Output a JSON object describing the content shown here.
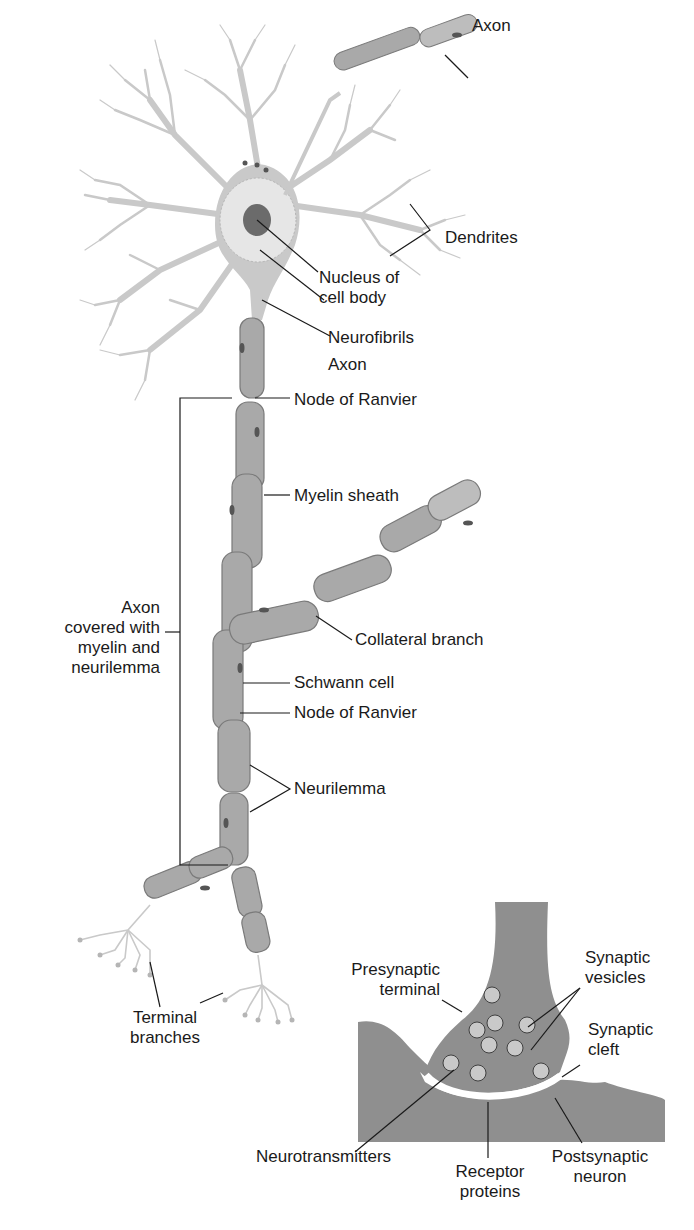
{
  "diagram": {
    "colors": {
      "cell_fill": "#c9c9c9",
      "sheath_fill": "#a9a9a9",
      "sheath_stroke": "#7a7a7a",
      "nucleus": "#6b6b6b",
      "synapse_fill": "#8f8f8f",
      "cleft": "#ffffff",
      "leader_line": "#1a1a1a"
    },
    "labels": {
      "axon_top": "Axon",
      "dendrites": "Dendrites",
      "nucleus_line1": "Nucleus of",
      "nucleus_line2": "cell body",
      "neurofibrils": "Neurofibrils",
      "axon_mid": "Axon",
      "node_of_ranvier_1": "Node of Ranvier",
      "myelin_sheath": "Myelin sheath",
      "axon_covered_line1": "Axon",
      "axon_covered_line2": "covered with",
      "axon_covered_line3": "myelin and",
      "axon_covered_line4": "neurilemma",
      "collateral_branch": "Collateral branch",
      "schwann_cell": "Schwann cell",
      "node_of_ranvier_2": "Node of Ranvier",
      "neurilemma": "Neurilemma",
      "terminal_line1": "Terminal",
      "terminal_line2": "branches",
      "presynaptic_line1": "Presynaptic",
      "presynaptic_line2": "terminal",
      "vesicles_line1": "Synaptic",
      "vesicles_line2": "vesicles",
      "cleft_line1": "Synaptic",
      "cleft_line2": "cleft",
      "neurotransmitters": "Neurotransmitters",
      "receptor_line1": "Receptor",
      "receptor_line2": "proteins",
      "postsynaptic_line1": "Postsynaptic",
      "postsynaptic_line2": "neuron"
    }
  }
}
